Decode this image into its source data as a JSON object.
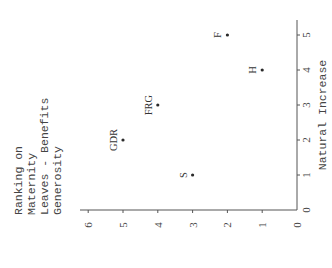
{
  "chart_data": {
    "type": "scatter",
    "title": "",
    "xlabel": "Natural Increase",
    "ylabel": "Ranking on Maternity Leaves - Benefits Generosity",
    "ylabel_lines": [
      "Ranking on",
      "Maternity",
      "Leaves - Benefits",
      "Generosity"
    ],
    "xlim": [
      0,
      5
    ],
    "ylim": [
      0,
      6
    ],
    "x_ticks": [
      0,
      1,
      2,
      3,
      4,
      5
    ],
    "y_ticks": [
      0,
      1,
      2,
      3,
      4,
      5,
      6
    ],
    "grid": false,
    "legend": null,
    "orientation_note": "figure is rotated 90 degrees counter-clockwise on the page",
    "points": [
      {
        "label": "S",
        "x": 1,
        "y": 3
      },
      {
        "label": "GDR",
        "x": 2,
        "y": 5
      },
      {
        "label": "FRG",
        "x": 3,
        "y": 4
      },
      {
        "label": "H",
        "x": 4,
        "y": 1
      },
      {
        "label": "F",
        "x": 5,
        "y": 2
      }
    ]
  },
  "colors": {
    "ink": "#2a2a2a",
    "axis": "#555555",
    "background": "#ffffff"
  }
}
